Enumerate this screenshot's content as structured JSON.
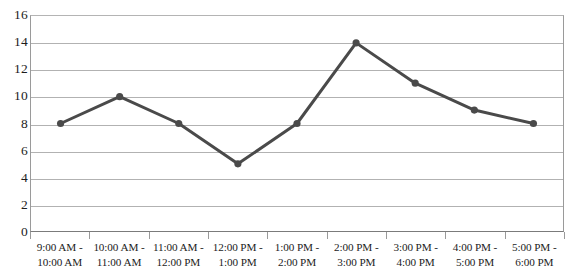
{
  "chart_data": {
    "type": "line",
    "title": "",
    "subtitle": "",
    "xlabel": "",
    "ylabel": "",
    "ylim": [
      0,
      16
    ],
    "y_ticks": [
      16,
      14,
      12,
      10,
      8,
      6,
      4,
      2,
      0
    ],
    "grid": true,
    "legend": "none",
    "categories": [
      "9:00 AM - 10:00 AM",
      "10:00 AM - 11:00 AM",
      "11:00 AM - 12:00 PM",
      "12:00 PM - 1:00 PM",
      "1:00 PM - 2:00 PM",
      "2:00 PM - 3:00 PM",
      "3:00 PM - 4:00 PM",
      "4:00 PM - 5:00 PM",
      "5:00 PM - 6:00 PM"
    ],
    "category_lines": [
      {
        "line1": "9:00 AM -",
        "line2": "10:00 AM"
      },
      {
        "line1": "10:00 AM -",
        "line2": "11:00 AM"
      },
      {
        "line1": "11:00 AM -",
        "line2": "12:00 PM"
      },
      {
        "line1": "12:00 PM -",
        "line2": "1:00 PM"
      },
      {
        "line1": "1:00 PM -",
        "line2": "2:00 PM"
      },
      {
        "line1": "2:00 PM -",
        "line2": "3:00 PM"
      },
      {
        "line1": "3:00 PM -",
        "line2": "4:00 PM"
      },
      {
        "line1": "4:00 PM -",
        "line2": "5:00 PM"
      },
      {
        "line1": "5:00 PM -",
        "line2": "6:00 PM"
      }
    ],
    "values": [
      8,
      10,
      8,
      5,
      8,
      14,
      11,
      9,
      8
    ],
    "colors": {
      "line": "#4a4a4a",
      "marker": "#4a4a4a",
      "gridline": "#b2b2b2",
      "axis": "#7b7b7b",
      "text": "#1c1c1c",
      "background": "#ffffff"
    },
    "style": {
      "line_width": 3,
      "marker_radius": 3.6,
      "marker_shape": "circle"
    }
  }
}
